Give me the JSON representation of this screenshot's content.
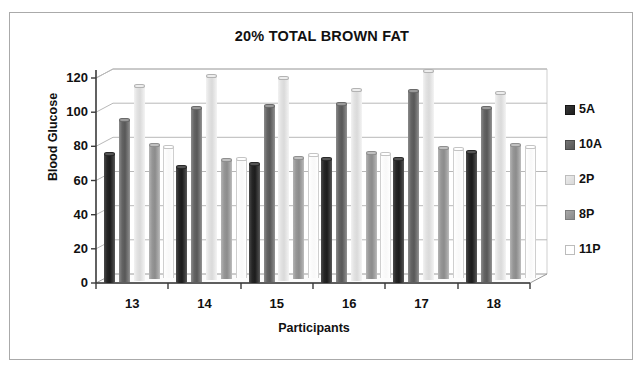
{
  "figure": {
    "title": "20% TOTAL BROWN FAT"
  },
  "axes": {
    "y_title": "Blood Glucose",
    "x_title": "Participants",
    "y_ticks": [
      "120",
      "100",
      "80",
      "60",
      "40",
      "20",
      "0"
    ],
    "x_ticks": [
      "13",
      "14",
      "15",
      "16",
      "17",
      "18"
    ]
  },
  "legend": {
    "items": [
      {
        "label": "5A",
        "color": "#1d1d1d"
      },
      {
        "label": "10A",
        "color": "#585858"
      },
      {
        "label": "2P",
        "color": "#dadada"
      },
      {
        "label": "8P",
        "color": "#8c8c8c"
      },
      {
        "label": "11P",
        "color": "#ffffff"
      }
    ]
  },
  "chart_data": {
    "type": "bar",
    "title": "20% TOTAL BROWN FAT",
    "xlabel": "Participants",
    "ylabel": "Blood Glucose",
    "ylim": [
      0,
      120
    ],
    "ytick_step": 20,
    "grid": true,
    "legend_position": "right",
    "style": "3d-clustered-cylinder",
    "categories": [
      "13",
      "14",
      "15",
      "16",
      "17",
      "18"
    ],
    "series": [
      {
        "name": "5A",
        "values": [
          77,
          69,
          71,
          74,
          74,
          78
        ]
      },
      {
        "name": "10A",
        "values": [
          96,
          103,
          104,
          105,
          113,
          103
        ]
      },
      {
        "name": "2P",
        "values": [
          115,
          121,
          120,
          113,
          124,
          111
        ]
      },
      {
        "name": "8P",
        "values": [
          80,
          71,
          72,
          75,
          78,
          80
        ]
      },
      {
        "name": "11P",
        "values": [
          78,
          71,
          73,
          74,
          77,
          78
        ]
      }
    ]
  }
}
